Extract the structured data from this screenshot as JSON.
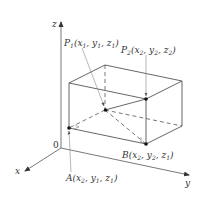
{
  "diagram": {
    "type": "3d-coordinate-box",
    "colors": {
      "line": "#555555",
      "leader": "#888888",
      "point": "#111111",
      "text": "#333333"
    },
    "axes": {
      "x": {
        "label": "x"
      },
      "y": {
        "label": "y"
      },
      "z": {
        "label": "z"
      },
      "origin": {
        "label": "0"
      }
    },
    "points": {
      "P1": {
        "name": "P",
        "sub": "1",
        "coords": [
          {
            "v": "x",
            "s": "1"
          },
          {
            "v": "y",
            "s": "1"
          },
          {
            "v": "z",
            "s": "1"
          }
        ]
      },
      "P2": {
        "name": "P",
        "sub": "2",
        "coords": [
          {
            "v": "x",
            "s": "2"
          },
          {
            "v": "y",
            "s": "2"
          },
          {
            "v": "z",
            "s": "2"
          }
        ]
      },
      "A": {
        "name": "A",
        "sub": "",
        "coords": [
          {
            "v": "x",
            "s": "2"
          },
          {
            "v": "y",
            "s": "1"
          },
          {
            "v": "z",
            "s": "1"
          }
        ]
      },
      "B": {
        "name": "B",
        "sub": "",
        "coords": [
          {
            "v": "x",
            "s": "2"
          },
          {
            "v": "y",
            "s": "2"
          },
          {
            "v": "z",
            "s": "1"
          }
        ]
      }
    }
  }
}
